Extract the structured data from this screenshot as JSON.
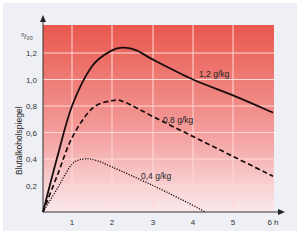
{
  "chart_data": {
    "type": "line",
    "title": "",
    "xlabel": "h",
    "ylabel": "Blutalkoholspiegel",
    "yunit": "‰",
    "xlim": [
      0,
      6
    ],
    "ylim": [
      0,
      1.3
    ],
    "x_ticks": [
      "1",
      "2",
      "3",
      "4",
      "5",
      "6 h"
    ],
    "y_ticks": [
      "0,2",
      "0,4",
      "0,6",
      "0,8",
      "1,0",
      "1,2"
    ],
    "grid": true,
    "background": {
      "top": "#e9584e",
      "bottom": "#fbe9ec"
    },
    "series": [
      {
        "name": "1,2 g/kg",
        "style": "solid",
        "x": [
          0,
          0.5,
          1,
          1.5,
          2,
          2.3,
          2.6,
          3,
          4,
          5,
          6
        ],
        "y": [
          0,
          0.42,
          0.8,
          1.1,
          1.22,
          1.24,
          1.22,
          1.15,
          1.0,
          0.88,
          0.75
        ]
      },
      {
        "name": "0,8 g/kg",
        "style": "dashed",
        "x": [
          0,
          0.5,
          1,
          1.5,
          2,
          2.3,
          3,
          4,
          5,
          6
        ],
        "y": [
          0,
          0.28,
          0.56,
          0.78,
          0.84,
          0.83,
          0.72,
          0.57,
          0.42,
          0.27
        ]
      },
      {
        "name": "0,4 g/kg",
        "style": "dotted",
        "x": [
          0,
          0.5,
          1,
          1.3,
          1.6,
          2,
          3,
          4,
          4.3
        ],
        "y": [
          0,
          0.18,
          0.36,
          0.4,
          0.39,
          0.34,
          0.2,
          0.05,
          0
        ]
      }
    ]
  },
  "labels": {
    "series1": "1,2 g/kg",
    "series2": "0,8 g/kg",
    "series3": "0,4 g/kg",
    "yunit": "⁰/₀₀",
    "ylabel": "Blutalkoholspiegel"
  }
}
